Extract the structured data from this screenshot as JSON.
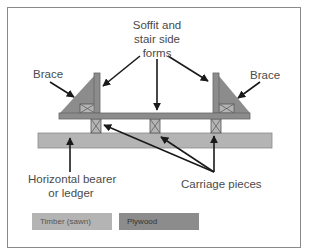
{
  "diagram": {
    "type": "formwork cross-section",
    "labels": {
      "soffit_forms_line1": "Soffit and",
      "soffit_forms_line2": "stair side",
      "soffit_forms_line3": "forms",
      "brace_left": "Brace",
      "brace_right": "Brace",
      "bearer_line1": "Horizontal bearer",
      "bearer_line2": "or ledger",
      "carriage": "Carriage pieces"
    },
    "legend": [
      {
        "label": "Timber (sawn)",
        "color": "#b4b4b4"
      },
      {
        "label": "Plywood",
        "color": "#8c8c8c"
      }
    ],
    "colors": {
      "timber": "#b4b4b4",
      "plywood": "#8c8c8c",
      "brace": "#8c8c8c",
      "outline": "#666666",
      "arrow": "#1a1a1a",
      "frame": "#8a8a8a"
    }
  }
}
